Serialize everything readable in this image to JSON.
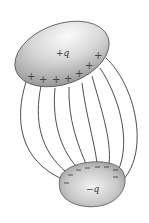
{
  "diagram": {
    "title": "",
    "type": "two charged conductors with electric field lines",
    "top_conductor": {
      "label": "+q",
      "charge_sign": "+",
      "surface_charges": [
        "+",
        "+",
        "+",
        "+",
        "+",
        "+",
        "+",
        "+"
      ]
    },
    "bottom_conductor": {
      "label": "−q",
      "charge_sign": "−",
      "surface_charges": [
        "−",
        "−",
        "−",
        "−",
        "−",
        "−",
        "−",
        "−",
        "−",
        "−"
      ]
    },
    "field_line_count": 8,
    "colors": {
      "background": "#ffffff",
      "conductor_light": "#f4f4f4",
      "conductor_dark": "#8a8a8a",
      "outline": "#555555",
      "field_line": "#3a3a3a"
    }
  }
}
